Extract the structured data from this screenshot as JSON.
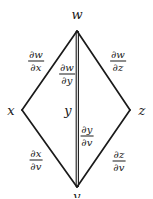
{
  "figure": {
    "type": "chain-rule-tree-diagram",
    "background_color": "#ffffff",
    "line_color": "#1a1a1a",
    "text_color": "#1a1a1a"
  },
  "nodes": {
    "top": {
      "label": "w",
      "x": 77,
      "y": 14
    },
    "left": {
      "label": "x",
      "x": 11,
      "y": 110
    },
    "middle": {
      "label": "y",
      "x": 68,
      "y": 110
    },
    "right": {
      "label": "z",
      "x": 142,
      "y": 110
    },
    "bottom": {
      "label": "v",
      "x": 77,
      "y": 196
    }
  },
  "edge_labels": {
    "upper_left": {
      "numerator": "∂w",
      "denominator": "∂x",
      "x": 36,
      "y": 61
    },
    "upper_middle": {
      "numerator": "∂w",
      "denominator": "∂y",
      "x": 67,
      "y": 74
    },
    "upper_right": {
      "numerator": "∂w",
      "denominator": "∂z",
      "x": 118,
      "y": 61
    },
    "lower_middle": {
      "numerator": "∂y",
      "denominator": "∂v",
      "x": 87,
      "y": 136
    },
    "lower_left": {
      "numerator": "∂x",
      "denominator": "∂v",
      "x": 36,
      "y": 160
    },
    "lower_right": {
      "numerator": "∂z",
      "denominator": "∂v",
      "x": 119,
      "y": 161
    }
  },
  "edges": [
    {
      "name": "w-to-x",
      "from": "top",
      "to": "left"
    },
    {
      "name": "w-to-y",
      "from": "top",
      "to": "middle"
    },
    {
      "name": "w-to-z",
      "from": "top",
      "to": "right"
    },
    {
      "name": "x-to-v",
      "from": "left",
      "to": "bottom"
    },
    {
      "name": "y-to-v",
      "from": "middle",
      "to": "bottom"
    },
    {
      "name": "z-to-v",
      "from": "right",
      "to": "bottom"
    }
  ]
}
